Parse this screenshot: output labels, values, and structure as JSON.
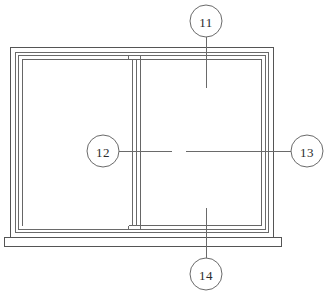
{
  "figure": {
    "type": "patent-line-drawing",
    "background_color": "#ffffff",
    "line_color": "#4a4a4a",
    "text_color": "#2b2b2b"
  },
  "callouts": [
    {
      "id": "callout-11",
      "label": "11",
      "position": "top",
      "points_to": "right-glass-pane-upper",
      "circle": {
        "cx": 206,
        "cy": 21,
        "r": 16
      },
      "leader": {
        "x1": 206,
        "y1": 37,
        "x2": 206,
        "y2": 88
      }
    },
    {
      "id": "callout-12",
      "label": "12",
      "position": "left",
      "points_to": "left-sash-center",
      "circle": {
        "cx": 103,
        "cy": 151,
        "r": 16
      },
      "leader": {
        "x1": 119,
        "y1": 151,
        "x2": 172,
        "y2": 151
      }
    },
    {
      "id": "callout-13",
      "label": "13",
      "position": "right",
      "points_to": "right-sash-center",
      "circle": {
        "cx": 307,
        "cy": 151,
        "r": 16
      },
      "leader": {
        "x1": 291,
        "y1": 151,
        "x2": 186,
        "y2": 151
      }
    },
    {
      "id": "callout-14",
      "label": "14",
      "position": "bottom",
      "points_to": "right-glass-pane-lower",
      "circle": {
        "cx": 206,
        "cy": 274,
        "r": 16
      },
      "leader": {
        "x1": 206,
        "y1": 258,
        "x2": 206,
        "y2": 208
      }
    }
  ],
  "parts": {
    "outer_frame": {
      "x": 10,
      "y": 47,
      "width": 264,
      "height": 190
    },
    "inner_frame_offset": 5,
    "sash_frame_offset": 9,
    "left_sash": {
      "x": 23,
      "y": 60,
      "width": 106,
      "height": 164
    },
    "right_sash": {
      "x": 140,
      "y": 60,
      "width": 123,
      "height": 164
    },
    "mullion": {
      "x": 129,
      "y": 56,
      "width": 11,
      "height": 172
    },
    "sill": {
      "x": 4,
      "y": 237,
      "width": 277,
      "height": 9
    }
  }
}
